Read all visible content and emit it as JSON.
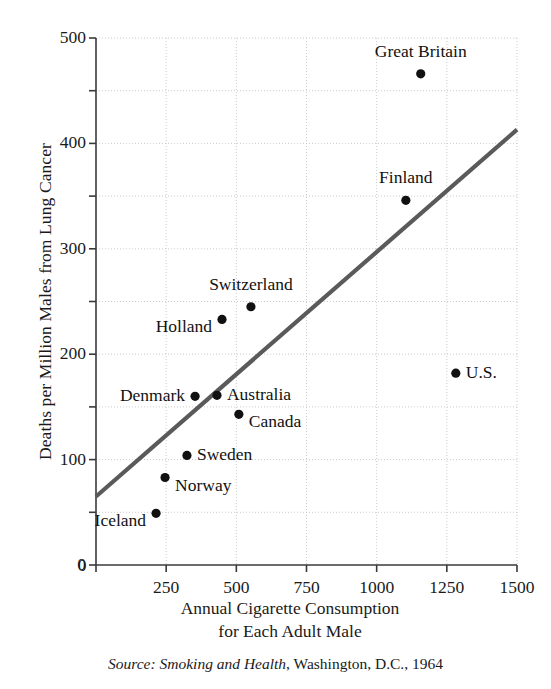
{
  "chart_data": {
    "type": "scatter",
    "title": "",
    "xlabel": "Annual Cigarette Consumption for Each Adult Male",
    "ylabel": "Deaths per Million Males from Lung Cancer",
    "xlim": [
      0,
      1500
    ],
    "ylim": [
      0,
      500
    ],
    "xticks": [
      0,
      250,
      500,
      750,
      1000,
      1250,
      1500
    ],
    "xtick_labels": [
      "0",
      "250",
      "500",
      "750",
      "1000",
      "1250",
      "1500"
    ],
    "yticks": [
      0,
      100,
      200,
      300,
      400,
      500
    ],
    "ytick_labels": [
      "0",
      "100",
      "200",
      "300",
      "400",
      "500"
    ],
    "y_minor_ticks": [
      50,
      150,
      250,
      350,
      450
    ],
    "grid": true,
    "grid_style": "dotted",
    "grid_color": "#cccccc",
    "points": [
      {
        "label": "Great Britain",
        "x": 1157,
        "y": 466,
        "label_pos": "above"
      },
      {
        "label": "Finland",
        "x": 1104,
        "y": 346,
        "label_pos": "above"
      },
      {
        "label": "Switzerland",
        "x": 552,
        "y": 245,
        "label_pos": "above"
      },
      {
        "label": "Holland",
        "x": 449,
        "y": 233,
        "label_pos": "below-left"
      },
      {
        "label": "Denmark",
        "x": 353,
        "y": 160,
        "label_pos": "left"
      },
      {
        "label": "Australia",
        "x": 431,
        "y": 161,
        "label_pos": "right"
      },
      {
        "label": "Canada",
        "x": 509,
        "y": 143,
        "label_pos": "below-right"
      },
      {
        "label": "U.S.",
        "x": 1282,
        "y": 182,
        "label_pos": "right"
      },
      {
        "label": "Sweden",
        "x": 324,
        "y": 104,
        "label_pos": "right"
      },
      {
        "label": "Norway",
        "x": 246,
        "y": 83,
        "label_pos": "below-right"
      },
      {
        "label": "Iceland",
        "x": 214,
        "y": 49,
        "label_pos": "below-left"
      }
    ],
    "trendline": {
      "x_start": 0,
      "y_start": 65,
      "x_end": 1500,
      "y_end": 413,
      "color": "#5a5a5a"
    },
    "marker_color": "#111111",
    "marker_size": 6
  },
  "axes": {
    "y_title": "Deaths per Million Males from Lung Cancer",
    "x_title_line1": "Annual Cigarette Consumption",
    "x_title_line2": "for Each Adult Male"
  },
  "source": {
    "prefix": "Source:",
    "work": "Smoking and Health",
    "rest": ", Washington, D.C., 1964"
  }
}
